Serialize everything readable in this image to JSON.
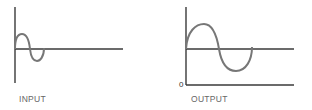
{
  "diagrams": [
    {
      "label": "INPUT",
      "description": "small-amplitude sine wave, one cycle"
    },
    {
      "label": "OUTPUT",
      "zero_label": "0",
      "description": "amplified sine wave, one cycle, with zero baseline"
    }
  ],
  "colors": {
    "axis": "#3a3a3a",
    "wave": "#777777",
    "label": "#666666"
  }
}
